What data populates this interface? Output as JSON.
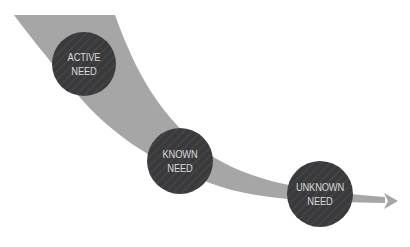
{
  "diagram": {
    "colors": {
      "band": "#a6a6a6",
      "node_fill": "#3a3a3c",
      "node_stripe": "#4a4a4c",
      "label": "#d8d8d8",
      "background": "#ffffff"
    },
    "nodes": [
      {
        "id": "active",
        "line1": "ACTIVE",
        "line2": "NEED",
        "cx": 84,
        "cy": 64,
        "r": 32
      },
      {
        "id": "known",
        "line1": "KNOWN",
        "line2": "NEED",
        "cx": 180,
        "cy": 161,
        "r": 33
      },
      {
        "id": "unknown",
        "line1": "UNKNOWN",
        "line2": "NEED",
        "cx": 320,
        "cy": 194,
        "r": 33
      }
    ],
    "arrow": {
      "tip_x": 398,
      "tip_y": 201
    }
  }
}
